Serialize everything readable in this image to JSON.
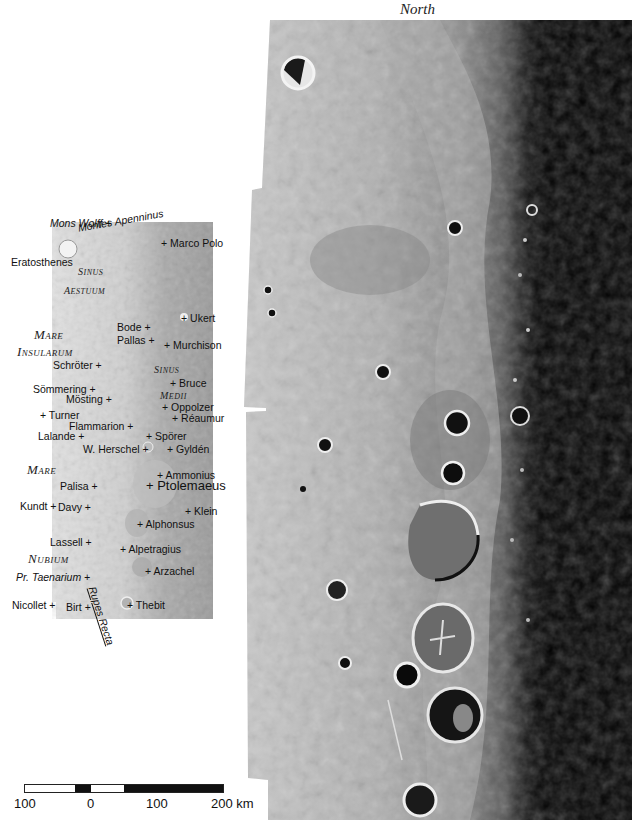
{
  "header": {
    "north_label": "North"
  },
  "colors": {
    "mare_gray": "#b8b8b8",
    "highland": "#d8d8d8",
    "terminator_dark": "#000000",
    "text": "#111111"
  },
  "keymap": {
    "features": [
      {
        "name": "Mons Wolff",
        "italic": true,
        "x": 50,
        "y": 217,
        "marker": "after"
      },
      {
        "name": "Montes Apenninus",
        "italic": true,
        "x": 77,
        "y": 222,
        "rotated": true,
        "marker": "none"
      },
      {
        "name": "Marco Polo",
        "x": 161,
        "y": 237,
        "marker": "before"
      },
      {
        "name": "Eratosthenes",
        "x": 11,
        "y": 256,
        "marker": "none"
      },
      {
        "name": "Ukert",
        "x": 181,
        "y": 312,
        "marker": "before"
      },
      {
        "name": "Bode",
        "x": 117,
        "y": 321,
        "marker": "after"
      },
      {
        "name": "Pallas",
        "x": 117,
        "y": 334,
        "marker": "after"
      },
      {
        "name": "Murchison",
        "x": 164,
        "y": 339,
        "marker": "before"
      },
      {
        "name": "Schröter",
        "x": 53,
        "y": 359,
        "marker": "after"
      },
      {
        "name": "Bruce",
        "x": 170,
        "y": 377,
        "marker": "before"
      },
      {
        "name": "Sömmering",
        "x": 33,
        "y": 383,
        "marker": "after"
      },
      {
        "name": "Mösting",
        "x": 66,
        "y": 393,
        "marker": "after"
      },
      {
        "name": "Oppolzer",
        "x": 162,
        "y": 401,
        "marker": "before"
      },
      {
        "name": "Turner",
        "x": 40,
        "y": 409,
        "marker": "before"
      },
      {
        "name": "Réaumur",
        "x": 172,
        "y": 412,
        "marker": "before"
      },
      {
        "name": "Flammarion",
        "x": 69,
        "y": 420,
        "marker": "after"
      },
      {
        "name": "Lalande",
        "x": 38,
        "y": 430,
        "marker": "after"
      },
      {
        "name": "Spörer",
        "x": 146,
        "y": 430,
        "marker": "before"
      },
      {
        "name": "W. Herschel",
        "x": 83,
        "y": 443,
        "marker": "after"
      },
      {
        "name": "Gyldén",
        "x": 167,
        "y": 443,
        "marker": "before"
      },
      {
        "name": "Ammonius",
        "x": 157,
        "y": 469,
        "marker": "before"
      },
      {
        "name": "Ptolemaeus",
        "x": 146,
        "y": 480,
        "marker": "before",
        "big": true
      },
      {
        "name": "Palisa",
        "x": 60,
        "y": 480,
        "marker": "after"
      },
      {
        "name": "Kundt",
        "x": 20,
        "y": 500,
        "marker": "after"
      },
      {
        "name": "Davy",
        "x": 58,
        "y": 501,
        "marker": "after"
      },
      {
        "name": "Klein",
        "x": 185,
        "y": 505,
        "marker": "before"
      },
      {
        "name": "Alphonsus",
        "x": 137,
        "y": 518,
        "marker": "before"
      },
      {
        "name": "Lassell",
        "x": 50,
        "y": 536,
        "marker": "after"
      },
      {
        "name": "Alpetragius",
        "x": 120,
        "y": 543,
        "marker": "before"
      },
      {
        "name": "Arzachel",
        "x": 145,
        "y": 565,
        "marker": "before"
      },
      {
        "name": "Pr. Taenarium",
        "italic": true,
        "x": 16,
        "y": 571,
        "marker": "after"
      },
      {
        "name": "Nicollet",
        "x": 12,
        "y": 599,
        "marker": "after"
      },
      {
        "name": "Birt",
        "x": 66,
        "y": 601,
        "marker": "after"
      },
      {
        "name": "Thebit",
        "x": 127,
        "y": 599,
        "marker": "before"
      }
    ],
    "maria": [
      {
        "line1_cap": "S",
        "line1_rest": "INUS",
        "line2_cap": "A",
        "line2_rest": "ESTUUM",
        "x1": 78,
        "y1": 264,
        "x2": 64,
        "y2": 283,
        "small": true
      },
      {
        "line1_cap": "M",
        "line1_rest": "ARE",
        "line2_cap": "I",
        "line2_rest": "NSULARUM",
        "x1": 34,
        "y1": 328,
        "x2": 17,
        "y2": 345
      },
      {
        "line1_cap": "S",
        "line1_rest": "INUS",
        "line2_cap": "M",
        "line2_rest": "EDII",
        "x1": 154,
        "y1": 362,
        "x2": 160,
        "y2": 388,
        "small": true
      },
      {
        "line1_cap": "M",
        "line1_rest": "ARE",
        "line2_cap": "N",
        "line2_rest": "UBIUM",
        "x1": 27,
        "y1": 463,
        "x2": 28,
        "y2": 552
      }
    ],
    "rupes": "Rupes Recta"
  },
  "scale_bar": {
    "ticks": [
      {
        "label": "100",
        "x": 14
      },
      {
        "label": "0",
        "x": 87
      },
      {
        "label": "100",
        "x": 146
      },
      {
        "label": "200 km",
        "x": 211
      }
    ],
    "unit": "km"
  }
}
